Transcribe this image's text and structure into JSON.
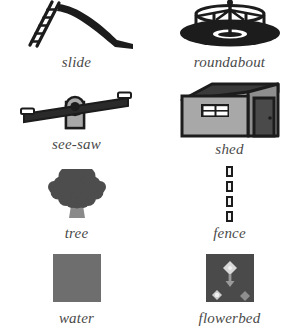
{
  "legend": {
    "columns": 2,
    "rows": 4,
    "label_style": "italic-serif",
    "colors": {
      "ink": "#1c1c1c",
      "label_text": "#4a4a4a",
      "mid_gray": "#9a9a9a",
      "water_gray": "#6e6e6e",
      "tree_canopy": "#4d4d4d",
      "tree_trunk": "#8a8a8a",
      "shed_wall": "#a8a8a8",
      "shed_roof": "#3a3a3a",
      "shed_door": "#4a4a4a",
      "window_pane": "#ffffff",
      "flowerbed_bg": "#4a4a4a",
      "flower_light": "#e8e8e8",
      "background": "#ffffff"
    },
    "items": [
      {
        "key": "slide",
        "label": "slide",
        "icon": "slide-icon",
        "row": 1,
        "col": 1
      },
      {
        "key": "roundabout",
        "label": "roundabout",
        "icon": "roundabout-icon",
        "row": 1,
        "col": 2
      },
      {
        "key": "see_saw",
        "label": "see-saw",
        "icon": "see-saw-icon",
        "row": 2,
        "col": 1
      },
      {
        "key": "shed",
        "label": "shed",
        "icon": "shed-icon",
        "row": 2,
        "col": 2
      },
      {
        "key": "tree",
        "label": "tree",
        "icon": "tree-icon",
        "row": 3,
        "col": 1
      },
      {
        "key": "fence",
        "label": "fence",
        "icon": "fence-icon",
        "row": 3,
        "col": 2
      },
      {
        "key": "water",
        "label": "water",
        "icon": "water-icon",
        "row": 4,
        "col": 1
      },
      {
        "key": "flowerbed",
        "label": "flowerbed",
        "icon": "flowerbed-icon",
        "row": 4,
        "col": 2
      }
    ],
    "fence": {
      "post_count": 4
    },
    "shed": {
      "window_panes": 4
    },
    "slide": {
      "ladder_rungs": 5
    }
  }
}
